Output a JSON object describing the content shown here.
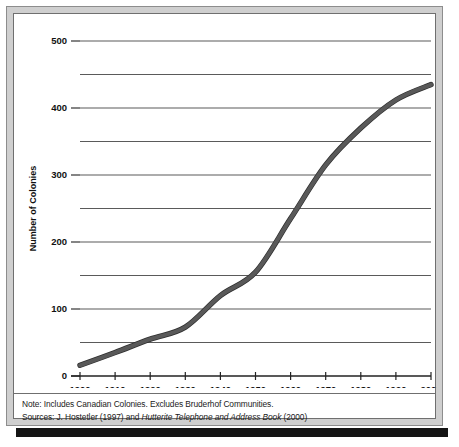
{
  "chart_data": {
    "type": "line",
    "title": "",
    "xlabel": "",
    "ylabel": "Number of Colonies",
    "x": [
      1900,
      1910,
      1920,
      1930,
      1940,
      1950,
      1960,
      1970,
      1980,
      1990,
      2000
    ],
    "values": [
      16,
      35,
      55,
      73,
      120,
      155,
      235,
      315,
      370,
      412,
      435
    ],
    "series": [
      {
        "name": "Number of Colonies",
        "values": [
          16,
          35,
          55,
          73,
          120,
          155,
          235,
          315,
          370,
          412,
          435
        ]
      }
    ],
    "xlim": [
      1900,
      2000
    ],
    "ylim": [
      0,
      500
    ],
    "x_tick_labels": [
      "1900",
      "1910",
      "1920",
      "1930",
      "1940",
      "1950",
      "1960",
      "1970",
      "1980",
      "1990",
      "2000"
    ],
    "y_tick_labels": [
      "0",
      "100",
      "200",
      "300",
      "400",
      "500"
    ],
    "y_ticks_major": [
      0,
      100,
      200,
      300,
      400,
      500
    ],
    "y_gridlines_all": [
      50,
      100,
      150,
      200,
      250,
      300,
      350,
      400,
      450,
      500
    ],
    "grid": "horizontal",
    "legend": "none",
    "line_color": "#595959",
    "line_width": 4
  },
  "notes": {
    "note_line": "Note: Includes Canadian Colonies. Excludes Bruderhof Communities.",
    "sources_prefix": "Sources: J. Hostetler (1997) and ",
    "sources_italic": "Hutterite Telephone and Address Book",
    "sources_suffix": " (2000)"
  },
  "colors": {
    "frame": "#cfcfcf",
    "frame_border": "#8d8d8d",
    "plot_border": "#6f6f6f",
    "line": "#595959",
    "grid": "#5a5a5a",
    "axis": "#222222",
    "text": "#111111",
    "shadow": "#141414"
  }
}
